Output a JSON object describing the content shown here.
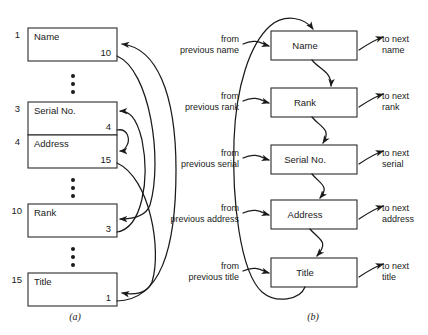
{
  "figure": {
    "caption_a": "(a)",
    "caption_b": "(b)"
  },
  "panel_a": {
    "rows": [
      {
        "index": "1",
        "field": "Name",
        "pointer": "10"
      },
      {
        "index": "3",
        "field": "Serial No.",
        "pointer": "4"
      },
      {
        "index": "4",
        "field": "Address",
        "pointer": "15"
      },
      {
        "index": "10",
        "field": "Rank",
        "pointer": "3"
      },
      {
        "index": "15",
        "field": "Title",
        "pointer": "1"
      }
    ],
    "ellipsis_glyph": "•"
  },
  "panel_b": {
    "nodes": [
      {
        "label": "Name",
        "in_label_line1": "from",
        "in_label_line2": "previous name",
        "out_label_line1": "to next",
        "out_label_line2": "name"
      },
      {
        "label": "Rank",
        "in_label_line1": "from",
        "in_label_line2": "previous rank",
        "out_label_line1": "to next",
        "out_label_line2": "rank"
      },
      {
        "label": "Serial No.",
        "in_label_line1": "from",
        "in_label_line2": "previous serial",
        "out_label_line1": "to next",
        "out_label_line2": "serial"
      },
      {
        "label": "Address",
        "in_label_line1": "from",
        "in_label_line2": "previous address",
        "out_label_line1": "to next",
        "out_label_line2": "address"
      },
      {
        "label": "Title",
        "in_label_line1": "from",
        "in_label_line2": "previous title",
        "out_label_line1": "to next",
        "out_label_line2": "title"
      }
    ]
  },
  "colors": {
    "ink": "#1a1a1a",
    "paper": "#ffffff"
  }
}
